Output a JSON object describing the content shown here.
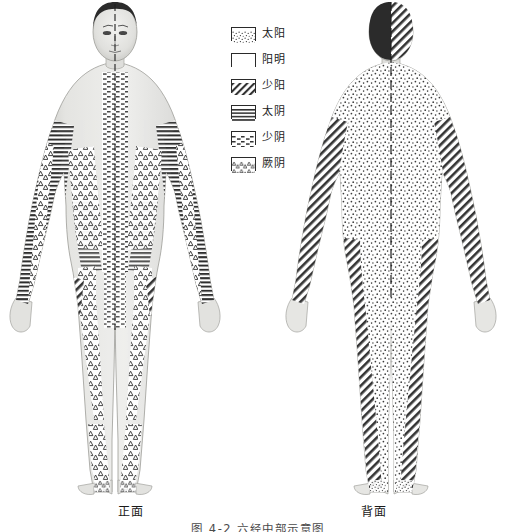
{
  "figure": {
    "title": "图 4-2  六经中部示意图",
    "front_caption": "正面",
    "back_caption": "背面"
  },
  "legend": {
    "items": [
      {
        "label": "太阳",
        "pattern": "stipple-dots",
        "pattern_name": "fine-dot-stipple"
      },
      {
        "label": "阳明",
        "pattern": "blank-white",
        "pattern_name": "empty-white"
      },
      {
        "label": "少阳",
        "pattern": "diagonal-hatch",
        "pattern_name": "diagonal-lines"
      },
      {
        "label": "太阴",
        "pattern": "horizontal-lines",
        "pattern_name": "horizontal-bands"
      },
      {
        "label": "少阴",
        "pattern": "dash-rows",
        "pattern_name": "short-dash-rows"
      },
      {
        "label": "厥阴",
        "pattern": "triangle-rows",
        "pattern_name": "small-triangles"
      }
    ]
  },
  "colors": {
    "ink": "#2a2a2a",
    "background": "#ffffff",
    "skin_light": "#e8e8e6",
    "skin_mid": "#d2d2cf",
    "skin_shadow": "#b4b4b0",
    "hair_dark": "#2b2b2b"
  }
}
